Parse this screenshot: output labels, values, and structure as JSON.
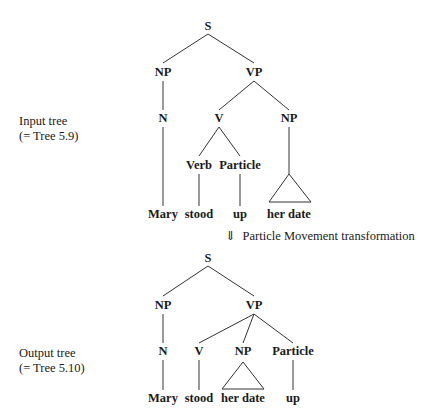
{
  "input_tree": {
    "caption_line1": "Input tree",
    "caption_line2": "(= Tree 5.9)",
    "nodes": {
      "S": "S",
      "NP": "NP",
      "VP": "VP",
      "N": "N",
      "V": "V",
      "NP2": "NP",
      "Verb": "Verb",
      "Particle": "Particle"
    },
    "leaves": {
      "mary": "Mary",
      "stood": "stood",
      "up": "up",
      "her_date": "her date"
    }
  },
  "transformation": {
    "arrow": "⇓",
    "label": "Particle Movement transformation"
  },
  "output_tree": {
    "caption_line1": "Output tree",
    "caption_line2": "(= Tree 5.10)",
    "nodes": {
      "S": "S",
      "NP": "NP",
      "VP": "VP",
      "N": "N",
      "V": "V",
      "NP2": "NP",
      "Particle": "Particle"
    },
    "leaves": {
      "mary": "Mary",
      "stood": "stood",
      "her_date": "her date",
      "up": "up"
    }
  }
}
